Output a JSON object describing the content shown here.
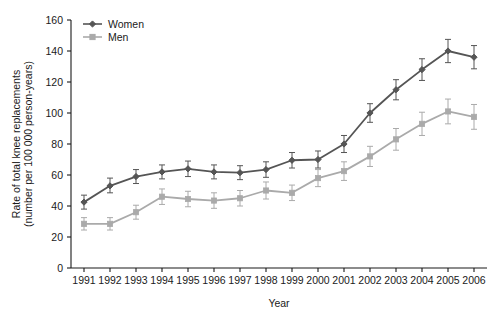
{
  "chart_data": {
    "type": "line",
    "title": "",
    "xlabel": "Year",
    "ylabel": "Rate of total knee replacements (number per 100 000 person-years)",
    "ylabel_line1": "Rate of total knee replacements",
    "ylabel_line2": "(number per 100 000 person-years)",
    "categories": [
      "1991",
      "1992",
      "1993",
      "1994",
      "1995",
      "1996",
      "1997",
      "1998",
      "1999",
      "2000",
      "2001",
      "2002",
      "2003",
      "2004",
      "2005",
      "2006"
    ],
    "x": [
      1991,
      1992,
      1993,
      1994,
      1995,
      1996,
      1997,
      1998,
      1999,
      2000,
      2001,
      2002,
      2003,
      2004,
      2005,
      2006
    ],
    "ylim": [
      0,
      160
    ],
    "yticks": [
      0,
      20,
      40,
      60,
      80,
      100,
      120,
      140,
      160
    ],
    "ytick_labels": [
      "0",
      "20",
      "40",
      "60",
      "80",
      "100",
      "120",
      "140",
      "160"
    ],
    "grid": false,
    "legend_position": "top-left",
    "error_bars": true,
    "series": [
      {
        "name": "Women",
        "color": "#555555",
        "marker": "diamond",
        "values": [
          42.5,
          53.0,
          59.0,
          62.0,
          64.0,
          62.0,
          61.5,
          63.5,
          69.5,
          70.0,
          80.0,
          100.0,
          115.0,
          128.0,
          140.0,
          136.0
        ],
        "err_low": [
          38.0,
          48.5,
          54.5,
          57.5,
          59.0,
          57.5,
          57.0,
          58.5,
          64.5,
          64.5,
          74.5,
          94.0,
          108.5,
          121.0,
          132.5,
          128.5
        ],
        "err_high": [
          47.0,
          58.0,
          63.5,
          66.5,
          69.0,
          66.5,
          66.0,
          68.5,
          74.5,
          75.5,
          85.5,
          106.0,
          121.5,
          135.0,
          147.5,
          143.5
        ]
      },
      {
        "name": "Men",
        "color": "#aaaaaa",
        "marker": "square",
        "values": [
          28.5,
          28.5,
          36.0,
          46.0,
          44.5,
          43.5,
          45.0,
          50.0,
          48.5,
          58.0,
          62.5,
          72.0,
          83.0,
          93.0,
          101.0,
          97.5
        ],
        "err_low": [
          24.5,
          24.5,
          31.5,
          41.0,
          39.5,
          38.5,
          40.0,
          44.5,
          43.5,
          52.5,
          56.5,
          65.5,
          76.0,
          85.5,
          93.0,
          89.5
        ],
        "err_high": [
          32.5,
          32.5,
          40.5,
          51.0,
          49.5,
          48.5,
          50.0,
          55.5,
          53.5,
          63.5,
          68.5,
          78.5,
          90.0,
          100.5,
          109.0,
          105.5
        ]
      }
    ]
  },
  "legend": {
    "items": [
      {
        "label": "Women",
        "color": "#555555"
      },
      {
        "label": "Men",
        "color": "#aaaaaa"
      }
    ]
  }
}
